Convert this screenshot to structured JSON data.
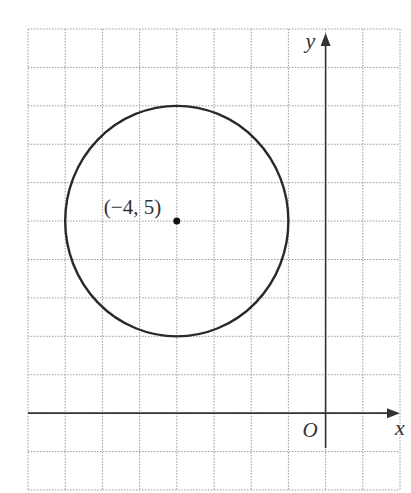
{
  "chart_data": {
    "type": "diagram",
    "title": "",
    "grid": {
      "on": true,
      "style": "dotted",
      "x_range": [
        -8,
        2
      ],
      "y_range": [
        -2,
        10
      ],
      "step": 1
    },
    "axes": {
      "x_label": "x",
      "y_label": "y",
      "origin_label": "O"
    },
    "circle": {
      "center": [
        -4,
        5
      ],
      "radius": 3
    },
    "points": [
      {
        "x": -4,
        "y": 5,
        "label": "(−4, 5)"
      }
    ]
  },
  "colors": {
    "grid": "#9a9a9a",
    "axis": "#333333",
    "curve": "#2a2a2a",
    "text": "#333333"
  }
}
